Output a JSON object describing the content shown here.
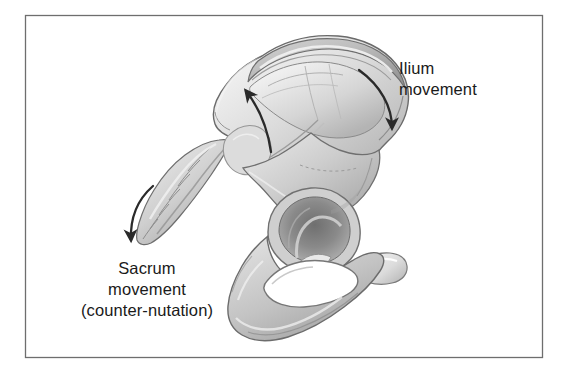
{
  "figure": {
    "background_color": "#ffffff",
    "frame": {
      "name": "figure-border",
      "color": "#6e6e6e",
      "x": 25,
      "y": 15,
      "width": 518,
      "height": 343
    },
    "bone_colors": {
      "outline": "#6a6a6a",
      "light": "#e8e8e8",
      "mid": "#c9c9c9",
      "shadow": "#9a9a9a",
      "deep_shadow": "#7a7a7a",
      "cavity": "#8d8d8d",
      "highlight": "#f4f4f4"
    },
    "arrow_color": "#2a2a2a"
  },
  "labels": [
    {
      "name": "ilium-movement-label",
      "lines": [
        "Ilium",
        "movement"
      ],
      "line1": "Ilium",
      "line2": "movement",
      "align": "left",
      "x": 399,
      "y": 58
    },
    {
      "name": "sacrum-movement-label",
      "lines": [
        "Sacrum",
        "movement",
        "(counter-nutation)"
      ],
      "line1": "Sacrum",
      "line2": "movement",
      "line3": "(counter-nutation)",
      "align": "center",
      "x": 78,
      "y": 258
    }
  ],
  "arrows": [
    {
      "name": "ilium-movement-arrow",
      "description": "curved arrow sweeping clockwise down along the posterior iliac crest",
      "direction": "down-right",
      "color": "#2a2a2a"
    },
    {
      "name": "sacrum-movement-arrow",
      "description": "curved arrow sweeping counter-clockwise down-left beside the sacrum",
      "direction": "down-left",
      "color": "#2a2a2a"
    },
    {
      "name": "iliac-fossa-internal-arrow",
      "description": "curved arrow inside the iliac fossa pointing up and to the left",
      "direction": "up-left",
      "color": "#2a2a2a"
    }
  ],
  "anatomy": [
    {
      "name": "ilium",
      "label": "Ilium"
    },
    {
      "name": "iliac-crest",
      "label": "Iliac crest"
    },
    {
      "name": "iliac-fossa",
      "label": "Iliac fossa"
    },
    {
      "name": "sacrum",
      "label": "Sacrum"
    },
    {
      "name": "coccyx",
      "label": "Coccyx"
    },
    {
      "name": "acetabulum",
      "label": "Acetabulum"
    },
    {
      "name": "obturator-foramen",
      "label": "Obturator foramen"
    },
    {
      "name": "ischium",
      "label": "Ischium"
    },
    {
      "name": "pubis",
      "label": "Pubis"
    },
    {
      "name": "greater-sciatic-notch",
      "label": "Greater sciatic notch"
    }
  ]
}
